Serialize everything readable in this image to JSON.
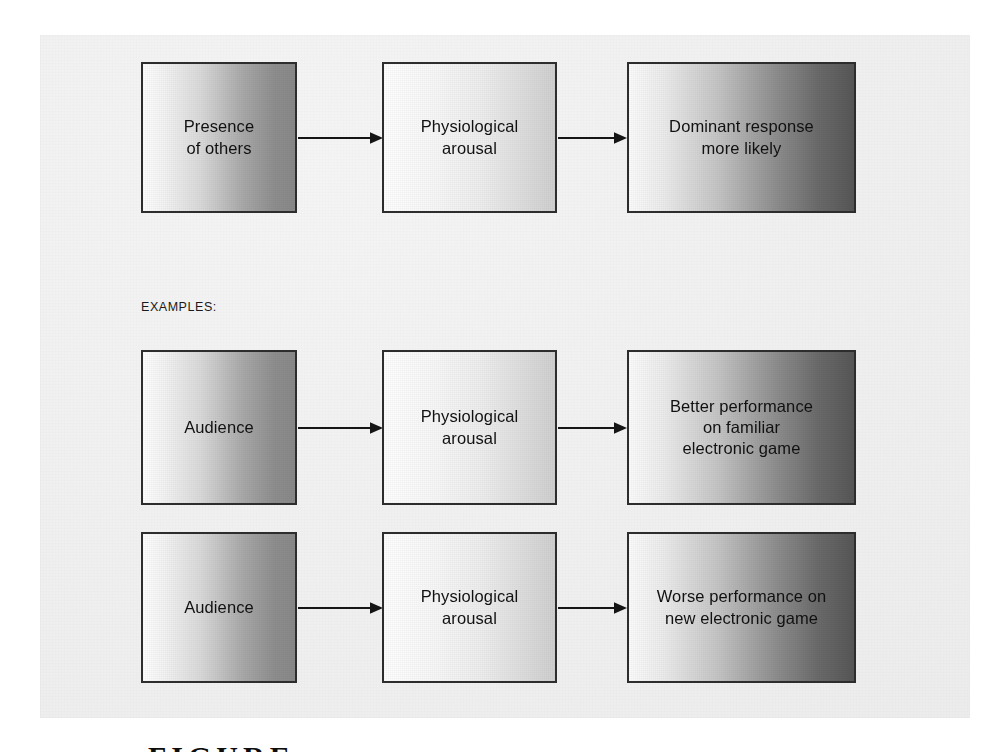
{
  "figure": {
    "background_color": "#efefef",
    "page_color": "#ffffff",
    "border_color": "#2d2d2d",
    "caption_text": "FIGURE"
  },
  "labels": {
    "examples": "EXAMPLES:"
  },
  "rows": [
    {
      "id": "row-theory",
      "nodes": [
        {
          "id": "presence-of-others",
          "text": "Presence\nof others",
          "shade": "grad-strong"
        },
        {
          "id": "physiological-arousal-1",
          "text": "Physiological\narousal",
          "shade": "grad-mild"
        },
        {
          "id": "dominant-response",
          "text": "Dominant response\nmore likely",
          "shade": "grad-dark"
        }
      ],
      "arrows": [
        "arrow-1",
        "arrow-2"
      ]
    },
    {
      "id": "row-example-familiar",
      "nodes": [
        {
          "id": "audience-1",
          "text": "Audience",
          "shade": "grad-strong"
        },
        {
          "id": "physiological-arousal-2",
          "text": "Physiological\narousal",
          "shade": "grad-mild"
        },
        {
          "id": "better-performance",
          "text": "Better performance\non familiar\nelectronic game",
          "shade": "grad-dark"
        }
      ],
      "arrows": [
        "arrow-3",
        "arrow-4"
      ]
    },
    {
      "id": "row-example-new",
      "nodes": [
        {
          "id": "audience-2",
          "text": "Audience",
          "shade": "grad-strong"
        },
        {
          "id": "physiological-arousal-3",
          "text": "Physiological\narousal",
          "shade": "grad-mild"
        },
        {
          "id": "worse-performance",
          "text": "Worse performance on\nnew electronic game",
          "shade": "grad-dark"
        }
      ],
      "arrows": [
        "arrow-5",
        "arrow-6"
      ]
    }
  ]
}
